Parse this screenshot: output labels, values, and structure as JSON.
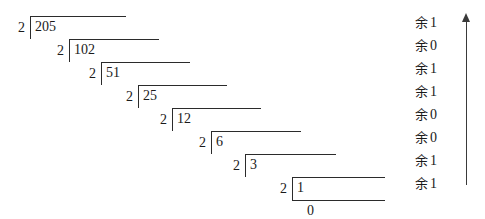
{
  "diagram": {
    "method": "repeated-division-by-2",
    "number": 205,
    "base": 2,
    "binary_result": "11001101",
    "line_color": "#2b2b2b",
    "arrow_color": "#3a3a3a",
    "background": "#ffffff"
  },
  "steps": [
    {
      "divisor": "2",
      "dividend": "205",
      "remainder_label": "余",
      "remainder_value": "1"
    },
    {
      "divisor": "2",
      "dividend": "102",
      "remainder_label": "余",
      "remainder_value": "0"
    },
    {
      "divisor": "2",
      "dividend": "51",
      "remainder_label": "余",
      "remainder_value": "1"
    },
    {
      "divisor": "2",
      "dividend": "25",
      "remainder_label": "余",
      "remainder_value": "1"
    },
    {
      "divisor": "2",
      "dividend": "12",
      "remainder_label": "余",
      "remainder_value": "0"
    },
    {
      "divisor": "2",
      "dividend": "6",
      "remainder_label": "余",
      "remainder_value": "0"
    },
    {
      "divisor": "2",
      "dividend": "3",
      "remainder_label": "余",
      "remainder_value": "1"
    },
    {
      "divisor": "2",
      "dividend": "1",
      "remainder_label": "余",
      "remainder_value": "1"
    }
  ],
  "final": {
    "quotient": "0"
  },
  "arrow": {
    "name": "read-upward-arrow",
    "direction": "up"
  }
}
